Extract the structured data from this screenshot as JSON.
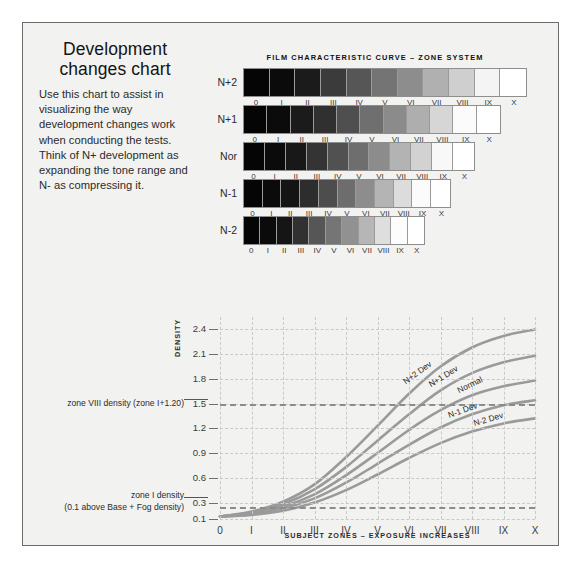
{
  "intro": {
    "title": "Development changes chart",
    "body": "Use this chart to assist in visualizing the way development changes work when conducting the tests. Think of N+ development as expanding the tone range and N- as compressing it."
  },
  "strips": {
    "title": "FILM CHARACTERISTIC CURVE – ZONE SYSTEM",
    "zone_labels": [
      "0",
      "I",
      "II",
      "III",
      "IV",
      "V",
      "VI",
      "VII",
      "VIII",
      "IX",
      "X"
    ],
    "rows": [
      {
        "label": "N+2",
        "width_px": 284,
        "tones": [
          "#050505",
          "#0b0b0b",
          "#1b1b1b",
          "#3b3b3b",
          "#565656",
          "#747474",
          "#8d8d8d",
          "#b0b0b0",
          "#cfcfcf",
          "#f4f4f4",
          "#ffffff"
        ]
      },
      {
        "label": "N+1",
        "width_px": 258,
        "tones": [
          "#050505",
          "#0b0b0b",
          "#1b1b1b",
          "#303030",
          "#4f4f4f",
          "#6f6f6f",
          "#8b8b8b",
          "#aeaeae",
          "#d6d6d6",
          "#fbfbfb",
          "#ffffff"
        ]
      },
      {
        "label": "Nor",
        "width_px": 232,
        "tones": [
          "#050505",
          "#0b0b0b",
          "#181818",
          "#343434",
          "#515151",
          "#6e6e6e",
          "#8c8c8c",
          "#b3b3b3",
          "#d2d2d2",
          "#f8f8f8",
          "#ffffff"
        ]
      },
      {
        "label": "N-1",
        "width_px": 208,
        "tones": [
          "#050505",
          "#0b0b0b",
          "#141414",
          "#2d2d2d",
          "#4d4d4d",
          "#6d6d6d",
          "#8d8d8d",
          "#b4b4b4",
          "#dcdcdc",
          "#fbfbfb",
          "#ffffff"
        ]
      },
      {
        "label": "N-2",
        "width_px": 182,
        "tones": [
          "#050505",
          "#0b0b0b",
          "#151515",
          "#313131",
          "#565656",
          "#757575",
          "#919191",
          "#b6b6b6",
          "#dedede",
          "#fcfcfc",
          "#ffffff"
        ]
      }
    ]
  },
  "chart_data": {
    "type": "line",
    "title": "FILM CHARACTERISTIC CURVE – ZONE SYSTEM",
    "xlabel": "SUBJECT ZONES – EXPOSURE INCREASES",
    "ylabel": "DENSITY",
    "grid": true,
    "legend": "inline-curve-labels",
    "x": [
      "0",
      "I",
      "II",
      "III",
      "IV",
      "V",
      "VI",
      "VII",
      "VIII",
      "IX",
      "X"
    ],
    "xlim": [
      0,
      10
    ],
    "ylim": [
      0.1,
      2.55
    ],
    "ytick_labels": [
      "2.4",
      "2.1",
      "1.8",
      "1.5",
      "1.2",
      "0.9",
      "0.6",
      "0.3",
      "0.1"
    ],
    "ytick_values": [
      2.4,
      2.1,
      1.8,
      1.5,
      1.2,
      0.9,
      0.6,
      0.3,
      0.1
    ],
    "reference_lines": [
      {
        "value": 1.5,
        "label": "zone VIII density (zone I+1.20)"
      },
      {
        "value": 0.25,
        "label": "zone I density",
        "sublabel": "(0.1 above Base + Fog density)"
      }
    ],
    "series": [
      {
        "name": "N+2 Dev",
        "values": [
          0.13,
          0.19,
          0.31,
          0.52,
          0.85,
          1.23,
          1.62,
          1.95,
          2.18,
          2.32,
          2.4
        ]
      },
      {
        "name": "N+1 Dev",
        "values": [
          0.13,
          0.18,
          0.28,
          0.46,
          0.73,
          1.05,
          1.37,
          1.66,
          1.87,
          2.0,
          2.08
        ]
      },
      {
        "name": "Normal",
        "values": [
          0.13,
          0.17,
          0.25,
          0.4,
          0.63,
          0.9,
          1.18,
          1.42,
          1.6,
          1.71,
          1.78
        ]
      },
      {
        "name": "N-1 Dev",
        "values": [
          0.13,
          0.16,
          0.23,
          0.35,
          0.54,
          0.77,
          1.0,
          1.21,
          1.37,
          1.48,
          1.54
        ]
      },
      {
        "name": "N-2 Dev",
        "values": [
          0.13,
          0.15,
          0.2,
          0.3,
          0.45,
          0.64,
          0.84,
          1.02,
          1.16,
          1.26,
          1.32
        ]
      }
    ],
    "curve_color": "#9a9a9a"
  }
}
